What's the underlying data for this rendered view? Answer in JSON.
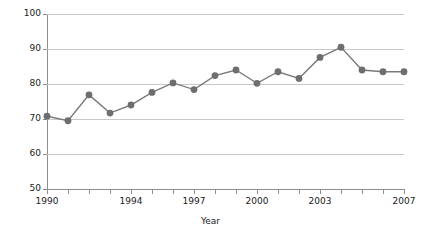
{
  "chart_data": {
    "type": "line",
    "title": "",
    "xlabel": "Year",
    "ylabel": "Positive results (%)",
    "x": [
      1990,
      1991,
      1992,
      1993,
      1994,
      1995,
      1996,
      1997,
      1998,
      1999,
      2000,
      2001,
      2002,
      2003,
      2004,
      2005,
      2006,
      2007
    ],
    "values": [
      70.8,
      69.5,
      76.9,
      71.7,
      74.0,
      77.6,
      80.3,
      78.4,
      82.4,
      84.0,
      80.2,
      83.5,
      81.6,
      87.6,
      90.5,
      84.0,
      83.5,
      83.5
    ],
    "series": [
      {
        "name": "Positive results",
        "values": [
          70.8,
          69.5,
          76.9,
          71.7,
          74.0,
          77.6,
          80.3,
          78.4,
          82.4,
          84.0,
          80.2,
          83.5,
          81.6,
          87.6,
          90.5,
          84.0,
          83.5,
          83.5
        ]
      }
    ],
    "xlim": [
      1990,
      2007
    ],
    "ylim": [
      50,
      100
    ],
    "yticks": [
      50,
      60,
      70,
      80,
      90,
      100
    ],
    "ytick_labels": [
      "50",
      "60",
      "70",
      "80",
      "90",
      "100"
    ],
    "xticks": [
      1990,
      1991,
      1992,
      1993,
      1994,
      1995,
      1996,
      1997,
      1998,
      1999,
      2000,
      2001,
      2002,
      2003,
      2004,
      2005,
      2006,
      2007
    ],
    "xtick_labels_shown": [
      {
        "value": 1990,
        "label": "1990"
      },
      {
        "value": 1994,
        "label": "1994"
      },
      {
        "value": 1997,
        "label": "1997"
      },
      {
        "value": 2000,
        "label": "2000"
      },
      {
        "value": 2003,
        "label": "2003"
      },
      {
        "value": 2007,
        "label": "2007"
      }
    ],
    "grid": true,
    "grid_axis": "y",
    "legend": false,
    "legend_position": "none",
    "marker": "circle",
    "colors": {
      "line": "#7a7a7a",
      "marker": "#6e6e6e",
      "grid": "#c9c9c9",
      "axis": "#8f8f8f",
      "text": "#1a1a1a",
      "background": "#ffffff"
    }
  }
}
